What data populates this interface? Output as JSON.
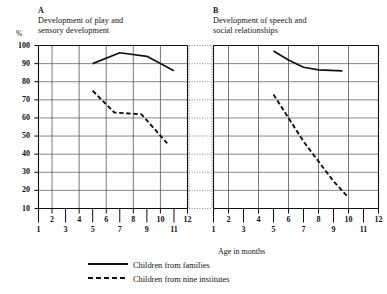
{
  "figure": {
    "y_axis_unit": "%",
    "x_axis_caption": "Age in months"
  },
  "panels": [
    {
      "letter": "A",
      "title": "Development of play and\nsensory development"
    },
    {
      "letter": "B",
      "title": "Development of speech and\nsocial relationships"
    }
  ],
  "y_ticks": [
    "100",
    "90",
    "80",
    "70",
    "60",
    "50",
    "40",
    "30",
    "20",
    "10"
  ],
  "x_ticks_upper": [
    "2",
    "4",
    "6",
    "8",
    "10",
    "12"
  ],
  "x_ticks_lower": [
    "1",
    "3",
    "5",
    "7",
    "9",
    "11"
  ],
  "legend": [
    {
      "style": "solid",
      "label": "Children from families"
    },
    {
      "style": "dashed",
      "label": "Children from nine institutes"
    }
  ],
  "colors": {
    "ink": "#111111",
    "grid": "#555555",
    "background": "#ffffff"
  },
  "chart_data": [
    {
      "type": "line",
      "title": "Development of play and sensory development",
      "panel": "A",
      "xlabel": "Age in months",
      "ylabel": "%",
      "xlim": [
        1,
        12
      ],
      "ylim": [
        10,
        100
      ],
      "grid": true,
      "legend_position": "below-figure",
      "series": [
        {
          "name": "Children from families",
          "style": "solid",
          "x": [
            5.0,
            7.0,
            9.0,
            11.0
          ],
          "y": [
            90,
            96,
            94,
            86
          ]
        },
        {
          "name": "Children from nine institutes",
          "style": "dashed",
          "x": [
            5.0,
            6.6,
            8.6,
            10.5
          ],
          "y": [
            75,
            63,
            62,
            46
          ]
        }
      ]
    },
    {
      "type": "line",
      "title": "Development of speech and social relationships",
      "panel": "B",
      "xlabel": "Age in months",
      "ylabel": "%",
      "xlim": [
        1,
        12
      ],
      "ylim": [
        10,
        100
      ],
      "grid": true,
      "legend_position": "below-figure",
      "series": [
        {
          "name": "Children from families",
          "style": "solid",
          "x": [
            5.0,
            6.0,
            7.0,
            8.0,
            9.6
          ],
          "y": [
            97,
            92,
            88,
            86.5,
            86
          ]
        },
        {
          "name": "Children from nine institutes",
          "style": "dashed",
          "x": [
            5.0,
            6.0,
            7.0,
            8.0,
            9.0,
            10.0
          ],
          "y": [
            73,
            60,
            47,
            36,
            25,
            16
          ]
        }
      ]
    }
  ]
}
